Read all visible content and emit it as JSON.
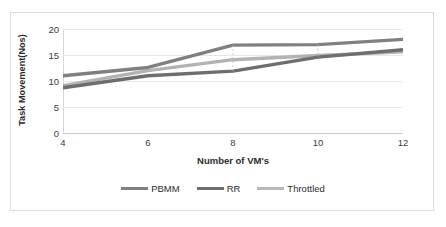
{
  "chart_data": {
    "type": "line",
    "title": "",
    "xlabel": "Number of VM's",
    "ylabel": "Task Movement(Nos)",
    "x": [
      4,
      6,
      8,
      10,
      12
    ],
    "xticklabels": [
      "4",
      "6",
      "8",
      "10",
      "12"
    ],
    "yticklabels": [
      "0",
      "5",
      "10",
      "15",
      "20"
    ],
    "yticks": [
      0,
      5,
      10,
      15,
      20
    ],
    "xlim": [
      4,
      12
    ],
    "ylim": [
      0,
      20
    ],
    "grid": "horizontal",
    "legend_position": "bottom",
    "series": [
      {
        "name": "PBMM",
        "values": [
          11.0,
          12.6,
          16.9,
          17.0,
          18.0
        ],
        "color": "#808080"
      },
      {
        "name": "RR",
        "values": [
          8.7,
          11.0,
          11.9,
          14.6,
          16.0
        ],
        "color": "#6e6e6e"
      },
      {
        "name": "Throttled",
        "values": [
          9.1,
          12.0,
          14.1,
          14.9,
          15.6
        ],
        "color": "#b3b3b3"
      }
    ]
  },
  "axis": {
    "y_title": "Task Movement(Nos)",
    "x_title": "Number of VM's",
    "y_ticks": [
      "20",
      "15",
      "10",
      "5",
      "0"
    ],
    "x_ticks": [
      "4",
      "6",
      "8",
      "10",
      "12"
    ]
  },
  "legend": {
    "items": [
      {
        "label": "PBMM",
        "color": "#808080"
      },
      {
        "label": "RR",
        "color": "#6e6e6e"
      },
      {
        "label": "Throttled",
        "color": "#b8b8b8"
      }
    ]
  }
}
